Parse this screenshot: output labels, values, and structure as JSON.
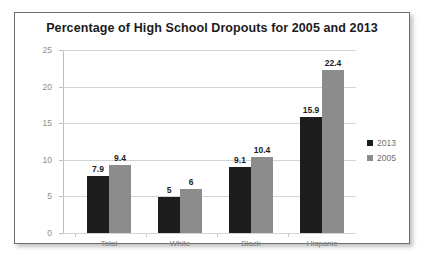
{
  "chart_data": {
    "type": "bar",
    "title": "Percentage of High School Dropouts for 2005 and 2013",
    "xlabel": "",
    "ylabel": "",
    "categories": [
      "Total",
      "White",
      "Black",
      "Hispanic"
    ],
    "series": [
      {
        "name": "2013",
        "color": "#1d1d1d",
        "values": [
          7.9,
          5,
          9.1,
          15.9
        ],
        "labels": [
          "7.9",
          "5",
          "9.1",
          "15.9"
        ]
      },
      {
        "name": "2005",
        "color": "#8c8c8c",
        "values": [
          9.4,
          6,
          10.4,
          22.4
        ],
        "labels": [
          "9.4",
          "6",
          "10.4",
          "22.4"
        ]
      }
    ],
    "ylim": [
      0,
      25
    ],
    "yticks": [
      0,
      5,
      10,
      15,
      20,
      25
    ],
    "ytick_labels": [
      "0",
      "5",
      "10",
      "15",
      "20",
      "25"
    ],
    "grid": true,
    "legend_position": "right"
  }
}
